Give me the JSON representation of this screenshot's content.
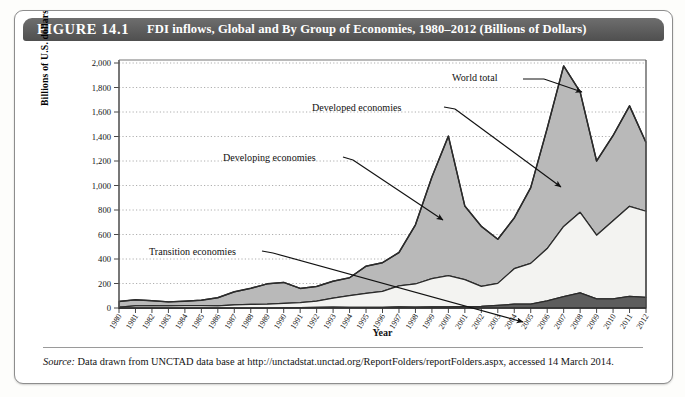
{
  "figure": {
    "number_label": "FIGURE 14.1",
    "title": "FDI inflows, Global and By Group of Economies, 1980–2012 (Billions of Dollars)"
  },
  "source_note": {
    "prefix": "Source:",
    "text": " Data drawn from UNCTAD data base at http://unctadstat.unctad.org/ReportFolders/reportFolders.aspx, accessed 14 March 2014."
  },
  "colors": {
    "header_bar": "#5b5b5b",
    "developed": "#b9b9b9",
    "developing": "#f3f3f1",
    "transition": "#5d5d5d",
    "outline": "#2b2b2b",
    "gridline": "#9b9b9b"
  },
  "annotations": [
    {
      "name": "world-total",
      "label": "World total"
    },
    {
      "name": "developed-economies",
      "label": "Developed economies"
    },
    {
      "name": "developing-economies",
      "label": "Developing economies"
    },
    {
      "name": "transition-economies",
      "label": "Transition economies"
    }
  ],
  "chart_data": {
    "type": "area",
    "stacked": true,
    "title": "FDI inflows, Global and By Group of Economies, 1980–2012 (Billions of Dollars)",
    "xlabel": "Year",
    "ylabel": "Billions of U.S. dollars",
    "ylim": [
      0,
      2000
    ],
    "ytick_step": 200,
    "yticks": [
      0,
      200,
      400,
      600,
      800,
      1000,
      1200,
      1400,
      1600,
      1800,
      2000
    ],
    "ytick_labels": [
      "0",
      "200",
      "400",
      "600",
      "800",
      "1,000",
      "1,200",
      "1,400",
      "1,600",
      "1,800",
      "2,000"
    ],
    "grid": "horizontal-dotted",
    "legend": "annotated-callouts",
    "categories": [
      1980,
      1981,
      1982,
      1983,
      1984,
      1985,
      1986,
      1987,
      1988,
      1989,
      1990,
      1991,
      1992,
      1993,
      1994,
      1995,
      1996,
      1997,
      1998,
      1999,
      2000,
      2001,
      2002,
      2003,
      2004,
      2005,
      2006,
      2007,
      2008,
      2009,
      2010,
      2011,
      2012
    ],
    "series": [
      {
        "name": "Transition economies",
        "stack_order": 1,
        "values": [
          0,
          0,
          0,
          0,
          0,
          0,
          0,
          0,
          0,
          0,
          2,
          3,
          5,
          7,
          6,
          5,
          6,
          9,
          8,
          9,
          9,
          12,
          13,
          21,
          31,
          32,
          58,
          92,
          123,
          75,
          75,
          95,
          87
        ]
      },
      {
        "name": "Developing economies",
        "stack_order": 2,
        "values": [
          8,
          17,
          20,
          17,
          20,
          20,
          17,
          25,
          30,
          31,
          35,
          41,
          51,
          73,
          95,
          114,
          130,
          172,
          188,
          231,
          256,
          219,
          164,
          180,
          290,
          332,
          427,
          574,
          658,
          519,
          637,
          735,
          703
        ]
      },
      {
        "name": "Developed economies",
        "stack_order": 3,
        "values": [
          46,
          50,
          40,
          33,
          36,
          44,
          67,
          107,
          131,
          166,
          172,
          116,
          120,
          139,
          146,
          222,
          234,
          272,
          483,
          830,
          1138,
          601,
          490,
          360,
          414,
          619,
          982,
          1310,
          983,
          606,
          696,
          820,
          561
        ]
      }
    ],
    "world_total": [
      54,
      67,
      60,
      50,
      56,
      64,
      84,
      132,
      161,
      197,
      209,
      160,
      176,
      219,
      247,
      341,
      370,
      453,
      679,
      1070,
      1403,
      832,
      667,
      561,
      735,
      983,
      1467,
      1976,
      1764,
      1200,
      1408,
      1650,
      1351
    ],
    "peaks": [
      {
        "year": 2000,
        "world_total": 1403
      },
      {
        "year": 2007,
        "world_total": 1976
      },
      {
        "year": 2011,
        "world_total": 1650
      }
    ]
  }
}
